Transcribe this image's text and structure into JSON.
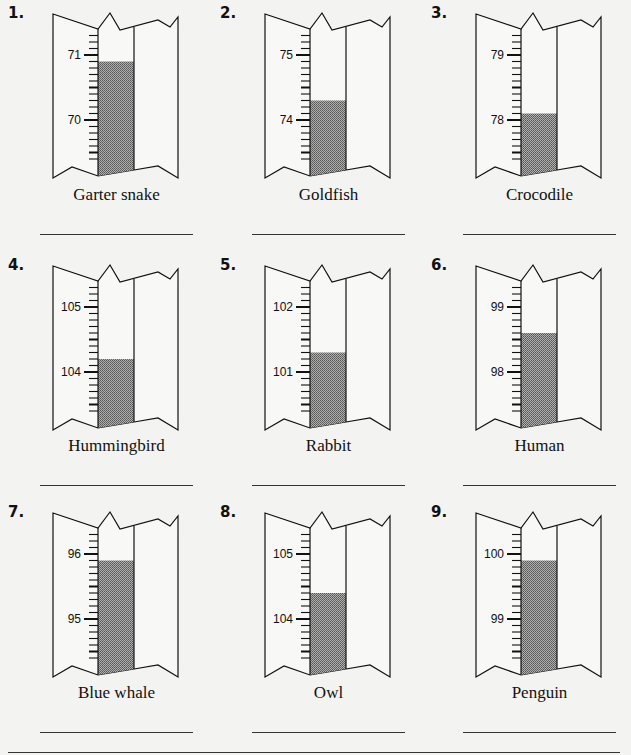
{
  "worksheet": {
    "items": [
      {
        "number": "1.",
        "animal": "Garter snake",
        "upper_label": "71",
        "lower_label": "70",
        "upper_value": 71,
        "reading": 70.9
      },
      {
        "number": "2.",
        "animal": "Goldfish",
        "upper_label": "75",
        "lower_label": "74",
        "upper_value": 75,
        "reading": 74.3
      },
      {
        "number": "3.",
        "animal": "Crocodile",
        "upper_label": "79",
        "lower_label": "78",
        "upper_value": 79,
        "reading": 78.1
      },
      {
        "number": "4.",
        "animal": "Hummingbird",
        "upper_label": "105",
        "lower_label": "104",
        "upper_value": 105,
        "reading": 104.2
      },
      {
        "number": "5.",
        "animal": "Rabbit",
        "upper_label": "102",
        "lower_label": "101",
        "upper_value": 102,
        "reading": 101.3
      },
      {
        "number": "6.",
        "animal": "Human",
        "upper_label": "99",
        "lower_label": "98",
        "upper_value": 99,
        "reading": 98.6
      },
      {
        "number": "7.",
        "animal": "Blue whale",
        "upper_label": "96",
        "lower_label": "95",
        "upper_value": 96,
        "reading": 95.9
      },
      {
        "number": "8.",
        "animal": "Owl",
        "upper_label": "105",
        "lower_label": "104",
        "upper_value": 105,
        "reading": 104.4
      },
      {
        "number": "9.",
        "animal": "Penguin",
        "upper_label": "100",
        "lower_label": "99",
        "upper_value": 100,
        "reading": 99.9
      }
    ],
    "answer_blanks": [
      "",
      "",
      "",
      "",
      "",
      "",
      "",
      "",
      ""
    ]
  },
  "colors": {
    "background": "#f3f3f1",
    "ink": "#111111",
    "fill": "#8a8a8a"
  }
}
